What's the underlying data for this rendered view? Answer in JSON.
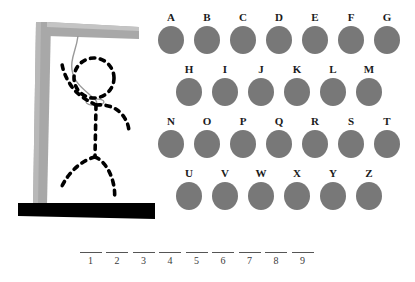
{
  "game": {
    "title": "Hangman",
    "theme": {
      "background": "#ffffff",
      "letter_circle_color": "#787878",
      "gallows_color": "#a8a8a8",
      "gallows_highlight": "#c4c4c4",
      "base_color": "#000000",
      "figure_color": "#000000",
      "rope_color": "#999999",
      "text_color": "#1b1b1b",
      "blank_line_color": "#555555"
    }
  },
  "gallows": {
    "name": "gallows-with-hanged-figure",
    "post_label": "vertical-post",
    "beam_label": "horizontal-beam",
    "base_label": "base-platform",
    "rope_label": "rope",
    "figure_parts": [
      "head",
      "left-arm",
      "right-arm",
      "torso",
      "left-leg",
      "right-leg"
    ],
    "figure_complete": true
  },
  "alphabet": {
    "rows": [
      {
        "row_index": 0,
        "indent": 0,
        "letters": [
          "A",
          "B",
          "C",
          "D",
          "E",
          "F",
          "G"
        ]
      },
      {
        "row_index": 1,
        "indent": 18,
        "letters": [
          "H",
          "I",
          "J",
          "K",
          "L",
          "M"
        ]
      },
      {
        "row_index": 2,
        "indent": 0,
        "letters": [
          "N",
          "O",
          "P",
          "Q",
          "R",
          "S",
          "T"
        ]
      },
      {
        "row_index": 3,
        "indent": 18,
        "letters": [
          "U",
          "V",
          "W",
          "X",
          "Y",
          "Z"
        ]
      }
    ]
  },
  "answer": {
    "slot_count": 9,
    "slots": [
      {
        "index": "1",
        "letter": ""
      },
      {
        "index": "2",
        "letter": ""
      },
      {
        "index": "3",
        "letter": ""
      },
      {
        "index": "4",
        "letter": ""
      },
      {
        "index": "5",
        "letter": ""
      },
      {
        "index": "6",
        "letter": ""
      },
      {
        "index": "7",
        "letter": ""
      },
      {
        "index": "8",
        "letter": ""
      },
      {
        "index": "9",
        "letter": ""
      }
    ]
  }
}
